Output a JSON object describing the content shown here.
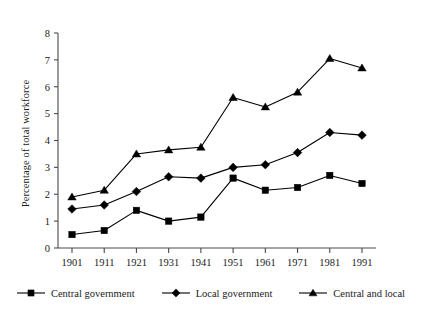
{
  "chart_data": {
    "type": "line",
    "title": "",
    "xlabel": "",
    "ylabel": "Percentage of total workforce",
    "categories": [
      "1901",
      "1911",
      "1921",
      "1931",
      "1941",
      "1951",
      "1961",
      "1971",
      "1981",
      "1991"
    ],
    "x": [
      1901,
      1911,
      1921,
      1931,
      1941,
      1951,
      1961,
      1971,
      1981,
      1991
    ],
    "xlim": [
      1901,
      1991
    ],
    "ylim": [
      0,
      8
    ],
    "yticks": [
      0,
      1,
      2,
      3,
      4,
      5,
      6,
      7,
      8
    ],
    "ytick_labels": [
      "0",
      "1",
      "2",
      "3",
      "4",
      "5",
      "6",
      "7",
      "8"
    ],
    "grid": false,
    "legend_position": "bottom",
    "series": [
      {
        "name": "Central government",
        "marker": "square",
        "color": "#000000",
        "values": [
          0.5,
          0.65,
          1.4,
          1.0,
          1.15,
          2.6,
          2.15,
          2.25,
          2.7,
          2.4
        ]
      },
      {
        "name": "Local government",
        "marker": "diamond",
        "color": "#000000",
        "values": [
          1.45,
          1.6,
          2.1,
          2.65,
          2.6,
          3.0,
          3.1,
          3.55,
          4.3,
          4.2
        ]
      },
      {
        "name": "Central and local",
        "marker": "triangle",
        "color": "#000000",
        "values": [
          1.9,
          2.15,
          3.5,
          3.65,
          3.75,
          5.6,
          5.25,
          5.8,
          7.05,
          6.7
        ]
      }
    ]
  },
  "axis": {
    "y_label": "Percentage of total workforce"
  },
  "legend": {
    "items": [
      {
        "label": "Central government",
        "marker": "square"
      },
      {
        "label": "Local government",
        "marker": "diamond"
      },
      {
        "label": "Central and local",
        "marker": "triangle"
      }
    ]
  }
}
